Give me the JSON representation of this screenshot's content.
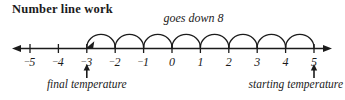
{
  "title": "Number line work",
  "caption": "goes down 8",
  "colors": {
    "ink": "#1b1b1b",
    "background": "#ffffff"
  },
  "annotations": {
    "left": {
      "label": "final temperature",
      "at_value": -3
    },
    "right": {
      "label": "starting temperature",
      "at_value": 5
    }
  },
  "chart_data": {
    "type": "line",
    "title": "Number line work",
    "subtitle": "goes down 8",
    "xlabel": "",
    "ylabel": "",
    "xlim": [
      -5,
      5
    ],
    "grid": false,
    "legend": null,
    "tick_values": [
      -5,
      -4,
      -3,
      -2,
      -1,
      0,
      1,
      2,
      3,
      4,
      5
    ],
    "tick_labels": [
      "⁻5",
      "⁻4",
      "⁻3",
      "⁻2",
      "⁻1",
      "0",
      "1",
      "2",
      "3",
      "4",
      "5"
    ],
    "start_value": 5,
    "end_value": -3,
    "change": -8,
    "jumps": [
      {
        "from": 5,
        "to": 4
      },
      {
        "from": 4,
        "to": 3
      },
      {
        "from": 3,
        "to": 2
      },
      {
        "from": 2,
        "to": 1
      },
      {
        "from": 1,
        "to": 0
      },
      {
        "from": 0,
        "to": -1
      },
      {
        "from": -1,
        "to": -2
      },
      {
        "from": -2,
        "to": -3
      }
    ],
    "jump_count": 8,
    "annotations": [
      {
        "text": "goes down 8",
        "at_value": 0
      },
      {
        "text": "final temperature",
        "at_value": -3
      },
      {
        "text": "starting temperature",
        "at_value": 5
      }
    ]
  }
}
